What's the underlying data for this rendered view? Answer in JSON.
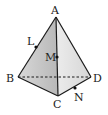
{
  "diagram": {
    "type": "tetrahedron",
    "vertices": {
      "A": {
        "label": "A",
        "x": 56,
        "y": 17
      },
      "B": {
        "label": "B",
        "x": 18,
        "y": 77
      },
      "C": {
        "label": "C",
        "x": 58,
        "y": 96
      },
      "D": {
        "label": "D",
        "x": 91,
        "y": 77
      }
    },
    "points": {
      "L": {
        "label": "L",
        "on": "AB"
      },
      "M": {
        "label": "M",
        "on": "AC"
      },
      "N": {
        "label": "N",
        "on": "CD"
      }
    },
    "colors": {
      "face_left": "#c4c4c4",
      "face_right": "#e2e2e2",
      "edge": "#1a1a1a"
    }
  }
}
